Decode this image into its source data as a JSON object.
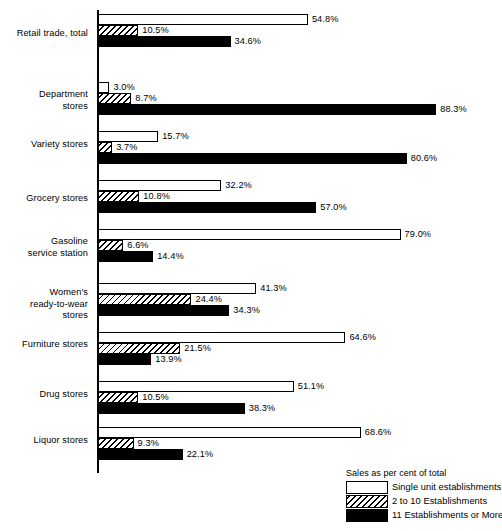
{
  "chart_data": {
    "type": "bar",
    "orientation": "horizontal",
    "title": "",
    "xlabel": "",
    "ylabel": "",
    "xlim": [
      0,
      100
    ],
    "grid": false,
    "legend_position": "bottom-right",
    "legend_title": "Sales as per cent of total",
    "categories": [
      "Retail trade, total",
      "Department\nstores",
      "Variety stores",
      "Grocery stores",
      "Gasoline\nservice station",
      "Women's\nready-to-wear\nstores",
      "Furniture stores",
      "Drug stores",
      "Liquor stores"
    ],
    "series": [
      {
        "name": "Single unit establishments",
        "fill": "white-outline",
        "values": [
          54.8,
          3.0,
          15.7,
          32.2,
          79.0,
          41.3,
          64.6,
          51.1,
          68.6
        ],
        "labels": [
          "54.8%",
          "3.0%",
          "15.7%",
          "32.2%",
          "79.0%",
          "41.3%",
          "64.6%",
          "51.1%",
          "68.6%"
        ]
      },
      {
        "name": "2 to 10 Establishments",
        "fill": "hatched",
        "values": [
          10.5,
          8.7,
          3.7,
          10.8,
          6.6,
          24.4,
          21.5,
          10.5,
          9.3
        ],
        "labels": [
          "10.5%",
          "8.7%",
          "3.7%",
          "10.8%",
          "6.6%",
          "24.4%",
          "21.5%",
          "10.5%",
          "9.3%"
        ]
      },
      {
        "name": "11 Establishments or More",
        "fill": "black",
        "values": [
          34.6,
          88.3,
          80.6,
          57.0,
          14.4,
          34.3,
          13.9,
          38.3,
          22.1
        ],
        "labels": [
          "34.6%",
          "88.3%",
          "80.6%",
          "57.0%",
          "14.4%",
          "34.3%",
          "13.9%",
          "38.3%",
          "22.1%"
        ]
      }
    ]
  },
  "legend": {
    "title": "Sales as per cent of total",
    "entries": [
      {
        "label": "Single unit establishments",
        "fill": "single"
      },
      {
        "label": "2 to 10 Establishments",
        "fill": "mid"
      },
      {
        "label": "11 Establishments or More",
        "fill": "large"
      }
    ]
  },
  "layout": {
    "group_tops": [
      14,
      82,
      131,
      180,
      229,
      283,
      332,
      381,
      427
    ],
    "label_tops": [
      28,
      89,
      139,
      193,
      236,
      287,
      339,
      389,
      435
    ],
    "px_per_percent": 3.83,
    "axis_color": "#000000",
    "bar_fill_black": "#000000",
    "bar_fill_white": "#ffffff",
    "background": "#ffffff"
  }
}
